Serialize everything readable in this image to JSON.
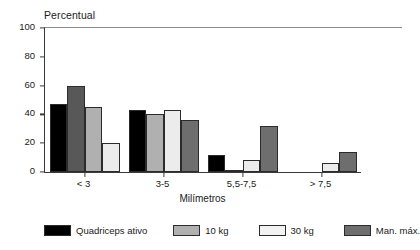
{
  "chart_data": {
    "type": "bar",
    "title": "",
    "ylabel": "Percentual",
    "xlabel": "Milímetros",
    "ylim": [
      0,
      100
    ],
    "yticks": [
      0,
      20,
      40,
      60,
      80,
      100
    ],
    "grid": false,
    "legend_position": "bottom",
    "categories": [
      "< 3",
      "3-5",
      "5,5-7,5",
      "> 7,5"
    ],
    "series": [
      {
        "name": "Quadriceps ativo",
        "color": "#000000",
        "values": [
          47,
          43,
          12,
          0
        ]
      },
      {
        "name": "10 kg",
        "color": "#5a5a5a",
        "values": [
          60,
          40,
          1,
          0
        ]
      },
      {
        "name": "30 kg",
        "color": "#e8e8e8",
        "values": [
          45,
          43,
          8,
          6
        ]
      },
      {
        "name": "Man. máx.",
        "color": "#9a9a9a",
        "values": [
          20,
          36,
          32,
          14
        ]
      }
    ],
    "series_render_colors": [
      "#000000",
      "#5a5a5a",
      "#b4b4b4",
      "#e8e8e8",
      "#6e6e6e"
    ],
    "bars": [
      {
        "group": "< 3",
        "series": "Quadriceps ativo",
        "value": 47,
        "color": "#000000"
      },
      {
        "group": "< 3",
        "series": "10 kg",
        "value": 60,
        "color": "#585858"
      },
      {
        "group": "< 3",
        "series": "30 kg",
        "value": 45,
        "color": "#b0b0b0"
      },
      {
        "group": "< 3",
        "series": "Man. máx.",
        "value": 20,
        "color": "#ececec"
      },
      {
        "group": "3-5",
        "series": "Quadriceps ativo",
        "value": 43,
        "color": "#000000"
      },
      {
        "group": "3-5",
        "series": "10 kg",
        "value": 40,
        "color": "#b0b0b0"
      },
      {
        "group": "3-5",
        "series": "30 kg",
        "value": 43,
        "color": "#ececec"
      },
      {
        "group": "3-5",
        "series": "Man. máx.",
        "value": 36,
        "color": "#6e6e6e"
      },
      {
        "group": "5,5-7,5",
        "series": "Quadriceps ativo",
        "value": 12,
        "color": "#000000"
      },
      {
        "group": "5,5-7,5",
        "series": "10 kg",
        "value": 1,
        "color": "#b0b0b0"
      },
      {
        "group": "5,5-7,5",
        "series": "30 kg",
        "value": 8,
        "color": "#ececec"
      },
      {
        "group": "5,5-7,5",
        "series": "Man. máx.",
        "value": 32,
        "color": "#6e6e6e"
      },
      {
        "group": "> 7,5",
        "series": "Quadriceps ativo",
        "value": 0,
        "color": "#000000"
      },
      {
        "group": "> 7,5",
        "series": "10 kg",
        "value": 0,
        "color": "#b0b0b0"
      },
      {
        "group": "> 7,5",
        "series": "30 kg",
        "value": 6,
        "color": "#ececec"
      },
      {
        "group": "> 7,5",
        "series": "Man. máx.",
        "value": 14,
        "color": "#6e6e6e"
      }
    ]
  },
  "legend": {
    "items": [
      {
        "label": "Quadriceps ativo",
        "color": "#000000"
      },
      {
        "label": "10 kg",
        "color": "#b0b0b0"
      },
      {
        "label": "30 kg",
        "color": "#f2f2f2"
      },
      {
        "label": "Man. máx.",
        "color": "#6e6e6e"
      }
    ]
  }
}
